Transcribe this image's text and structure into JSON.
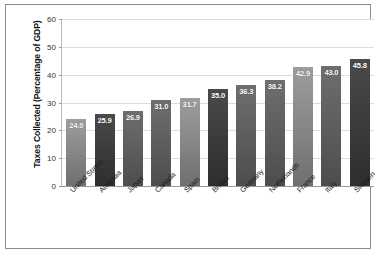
{
  "chart_data": {
    "type": "bar",
    "title": "",
    "xlabel": "",
    "ylabel": "Taxes Collected (Percentage of GDP)",
    "ylim": [
      0,
      60
    ],
    "yticks": [
      0,
      10,
      20,
      30,
      40,
      50,
      60
    ],
    "ytick_labels": [
      "0",
      "10",
      "20",
      "30",
      "40",
      "50",
      "60"
    ],
    "grid": true,
    "legend": "none",
    "categories": [
      "United States",
      "Australia",
      "Japan",
      "Canada",
      "Spain",
      "Britain",
      "Germany",
      "Netherlands",
      "France",
      "Italy",
      "Sweden"
    ],
    "values": [
      24.0,
      25.9,
      26.9,
      31.0,
      31.7,
      35.0,
      36.3,
      38.2,
      42.9,
      43.0,
      45.8
    ],
    "value_labels": [
      "24.0",
      "25.9",
      "26.9",
      "31.0",
      "31.7",
      "35.0",
      "36.3",
      "38.2",
      "42.9",
      "43.0",
      "45.8"
    ],
    "bar_shades": [
      "light",
      "dark",
      "mid",
      "mid",
      "light",
      "dark",
      "mid",
      "mid",
      "light",
      "mid",
      "dark"
    ],
    "colors": {
      "bar_light": "#8d8d8d",
      "bar_mid": "#5c5c5c",
      "bar_dark": "#3a3a3a",
      "gridline": "#dcdcdc",
      "axis": "#9a9a9a",
      "frame": "#8c8c8c",
      "value_text": "#ffffff",
      "background": "#ffffff"
    }
  }
}
